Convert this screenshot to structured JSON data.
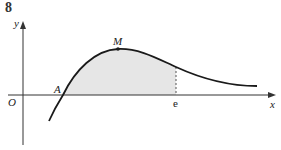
{
  "question_number": "8",
  "labels": {
    "y_axis": "y",
    "x_axis": "x",
    "origin": "O",
    "point_a": "A",
    "point_m": "M",
    "e_mark": "e"
  },
  "colors": {
    "curve": "#1a1a1a",
    "shading": "#e6e6e6",
    "axis": "#333333"
  }
}
